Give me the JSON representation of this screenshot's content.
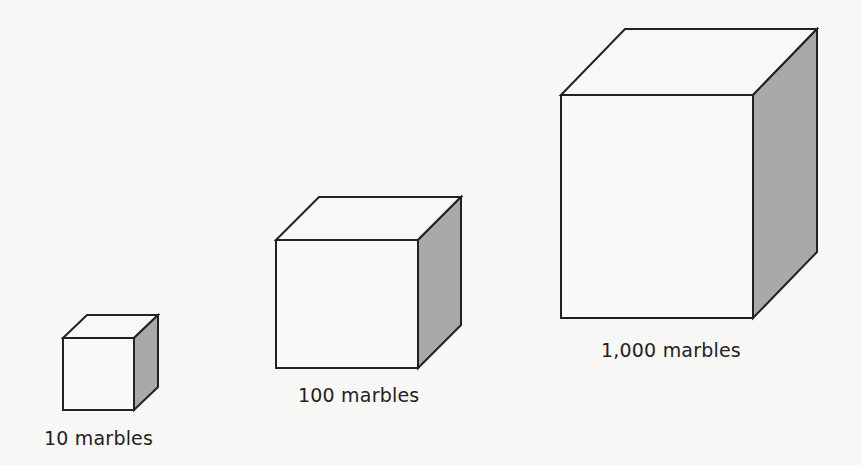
{
  "colors": {
    "background": "#f7f7f6",
    "front_face": "#fafafa",
    "top_face": "#f8f8f8",
    "side_face": "#a9a9a9",
    "stroke": "#222222",
    "label": "#222222"
  },
  "cubes": [
    {
      "label": "10 marbles",
      "front": {
        "x1": 63,
        "y1": 338,
        "x2": 134,
        "y2": 410
      },
      "back_offset": {
        "dx": 24,
        "dy": -23
      },
      "label_pos": {
        "x": 44,
        "y": 427
      }
    },
    {
      "label": "100 marbles",
      "front": {
        "x1": 276,
        "y1": 240,
        "x2": 418,
        "y2": 368
      },
      "back_offset": {
        "dx": 43,
        "dy": -43
      },
      "label_pos": {
        "x": 298,
        "y": 384
      }
    },
    {
      "label": "1,000 marbles",
      "front": {
        "x1": 561,
        "y1": 95,
        "x2": 753,
        "y2": 318
      },
      "back_offset": {
        "dx": 64,
        "dy": -66
      },
      "label_pos": {
        "x": 601,
        "y": 339
      }
    }
  ]
}
